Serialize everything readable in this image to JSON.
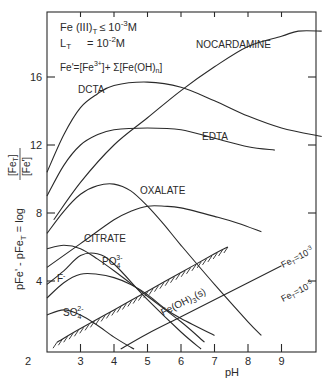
{
  "chart_data": {
    "type": "line",
    "title": "",
    "xlabel": "pH",
    "ylabel": "pFe' - pFe_T = log [Fe_T]/[Fe']",
    "xlim": [
      2,
      10.2
    ],
    "ylim": [
      0,
      19.8
    ],
    "x_ticks": [
      2,
      3,
      4,
      5,
      6,
      7,
      8,
      9
    ],
    "y_ticks": [
      4,
      8,
      12,
      16
    ],
    "grid": false,
    "annotations": {
      "conditions_line1": "Fe(III)_T ≤ 10^-3 M",
      "conditions_line2": "L_T = 10^-2 M",
      "definition": "Fe' = [Fe3+] + Σ[Fe(OH)n]",
      "precipitate_label": "Fe(OH)3(s)",
      "solubility_high": "Fe_T = 10^-3",
      "solubility_low": "Fe_T = 10^-5"
    },
    "series": [
      {
        "name": "NOCARDAMINE",
        "x": [
          2.2,
          3,
          4,
          5,
          6,
          7,
          8,
          9,
          9.5,
          10.2
        ],
        "y": [
          7.6,
          9.8,
          12,
          13.6,
          15.2,
          16.6,
          17.8,
          18.4,
          18.7,
          18.7
        ]
      },
      {
        "name": "DCTA",
        "x": [
          2,
          2.5,
          3,
          3.5,
          4,
          5,
          6,
          7,
          8,
          9,
          10.2
        ],
        "y": [
          10.4,
          12.6,
          14.2,
          15.0,
          15.5,
          15.7,
          15.4,
          14.6,
          13.7,
          13.0,
          12.5
        ]
      },
      {
        "name": "EDTA",
        "x": [
          2,
          2.5,
          3,
          3.5,
          4,
          5,
          6,
          7,
          8,
          8.8
        ],
        "y": [
          9.0,
          10.8,
          12.0,
          12.6,
          12.9,
          13.0,
          12.9,
          12.4,
          11.9,
          11.7
        ]
      },
      {
        "name": "OXALATE",
        "x": [
          2,
          2.5,
          3,
          3.5,
          4,
          4.5,
          5,
          5.5,
          6,
          7,
          8,
          8.4
        ],
        "y": [
          6.8,
          8.1,
          9.1,
          9.6,
          9.7,
          9.3,
          8.4,
          7.3,
          6.1,
          3.8,
          1.6,
          0.8
        ]
      },
      {
        "name": "CITRATE",
        "x": [
          2,
          3,
          4,
          4.5,
          5,
          5.5,
          6,
          7,
          7.7,
          8.4
        ],
        "y": [
          4.8,
          6.2,
          7.6,
          8.1,
          8.4,
          8.4,
          8.3,
          7.8,
          7.4,
          6.9
        ]
      },
      {
        "name": "PO4 3-",
        "x": [
          2,
          2.5,
          3,
          3.5,
          4,
          5,
          6,
          6.6
        ],
        "y": [
          3.8,
          4.6,
          5.5,
          5.6,
          5.0,
          2.9,
          1.0,
          0.0
        ]
      },
      {
        "name": "F-",
        "x": [
          2,
          2.5,
          3,
          3.5,
          4,
          5,
          6,
          6.7
        ],
        "y": [
          5.9,
          6.1,
          5.9,
          5.3,
          4.6,
          3.1,
          1.6,
          0.4
        ]
      },
      {
        "name": "PO4 3- (low branch)",
        "x": [
          2,
          2.5,
          3,
          3.5,
          4,
          4.5,
          5,
          5.5,
          6,
          7
        ],
        "y": [
          3.0,
          3.9,
          4.4,
          4.4,
          4.2,
          3.8,
          3.2,
          2.4,
          1.8,
          0.8
        ]
      },
      {
        "name": "SO4 2-",
        "x": [
          2,
          2.5,
          3,
          3.5,
          4,
          4.5,
          4.6
        ],
        "y": [
          2.0,
          2.3,
          2.0,
          1.4,
          0.7,
          0.1,
          0.0
        ]
      },
      {
        "name": "Fe_T = 10^-3 (Fe(OH)3(s) boundary)",
        "x": [
          2.3,
          3,
          4,
          5,
          6,
          7,
          7.4
        ],
        "y": [
          0.4,
          1.2,
          2.3,
          3.4,
          4.5,
          5.6,
          6.0
        ]
      },
      {
        "name": "Fe_T = 10^-5",
        "x": [
          4.2,
          5,
          6,
          7,
          8,
          9
        ],
        "y": [
          0.0,
          0.9,
          1.9,
          2.9,
          3.9,
          4.9
        ]
      }
    ]
  },
  "labels": {
    "cond1_main": "Fe (III)",
    "cond1_sub": "T",
    "cond1_rel": "≤ 10",
    "cond1_exp": "-3",
    "cond1_unit": "M",
    "cond2_main": "L",
    "cond2_sub": "T",
    "cond2_rel": "= 10",
    "cond2_exp": "-2",
    "cond2_unit": "M",
    "def_text": "Fe'=[Fe",
    "def_exp": "3+",
    "def_rest": "]+ Σ[Fe(OH)",
    "def_sub": "n",
    "def_end": "]",
    "nocardamine": "NOCARDAMINE",
    "dcta": "DCTA",
    "edta": "EDTA",
    "oxalate": "OXALATE",
    "citrate": "CITRATE",
    "po4": "PO",
    "po4_sub": "4",
    "po4_sup": "3-",
    "f": "F",
    "f_sup": "-",
    "so4": "SO",
    "so4_sub": "4",
    "so4_sup": "2-",
    "feoh3": "Fe(OH)",
    "feoh3_sub": "3",
    "feoh3_end": "(s)",
    "fet3": "Fe",
    "fet3_sub": "T",
    "fet3_rest": "=10",
    "fet3_exp": "-3",
    "fet5": "Fe",
    "fet5_sub": "T",
    "fet5_rest": "=10",
    "fet5_exp": "-5",
    "xlabel": "pH",
    "ylabel_main": "pFe' - pFe",
    "ylabel_sub": "T",
    "ylabel_eq": " = log ",
    "ylabel_frac_top": "[Fe",
    "ylabel_frac_top_sub": "T",
    "ylabel_frac_top_end": "]",
    "ylabel_frac_bot": "[Fe']"
  },
  "x_ticks": [
    "2",
    "3",
    "4",
    "5",
    "6",
    "7",
    "8",
    "9"
  ],
  "y_ticks": [
    "4",
    "8",
    "12",
    "16"
  ]
}
